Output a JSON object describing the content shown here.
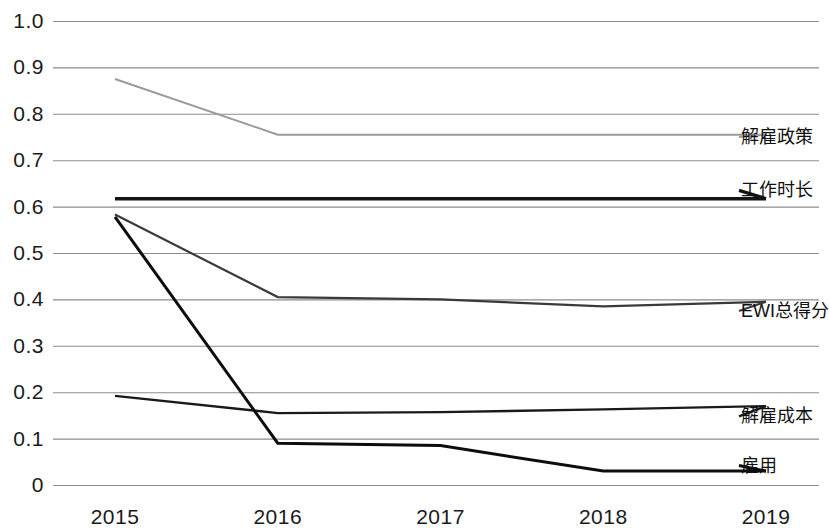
{
  "chart_data": {
    "type": "line",
    "title": "",
    "subtitle": "",
    "xlabel": "",
    "ylabel": "",
    "categories": [
      "2015",
      "2016",
      "2017",
      "2018",
      "2019"
    ],
    "x": [
      2015,
      2016,
      2017,
      2018,
      2019
    ],
    "ylim": [
      0,
      1.0
    ],
    "xlim": [
      2015,
      2019
    ],
    "grid": "horizontal",
    "legend_position": "right-inline-labels",
    "ytick_labels": [
      "1.0",
      "0.9",
      "0.8",
      "0.7",
      "0.6",
      "0.5",
      "0.4",
      "0.3",
      "0.2",
      "0.1",
      "0"
    ],
    "ytick_values": [
      1.0,
      0.9,
      0.8,
      0.7,
      0.6,
      0.5,
      0.4,
      0.3,
      0.2,
      0.1,
      0
    ],
    "series": [
      {
        "name": "解雇政策",
        "values": [
          0.875,
          0.755,
          0.755,
          0.755,
          0.755
        ],
        "color": "#9a9a9a",
        "width": 2.0,
        "label_y": 0.75
      },
      {
        "name": "工作时长",
        "values": [
          0.617,
          0.617,
          0.617,
          0.617,
          0.617
        ],
        "color": "#141414",
        "width": 3.4,
        "label_y": 0.635
      },
      {
        "name": "EWI总得分",
        "values": [
          0.583,
          0.405,
          0.4,
          0.385,
          0.395
        ],
        "color": "#3a3a3a",
        "width": 2.2,
        "label_y": 0.375
      },
      {
        "name": "解雇成本",
        "values": [
          0.192,
          0.155,
          0.157,
          0.163,
          0.17
        ],
        "color": "#1a1a1a",
        "width": 2.4,
        "label_y": 0.148
      },
      {
        "name": "雇用",
        "values": [
          0.578,
          0.09,
          0.085,
          0.03,
          0.03
        ],
        "color": "#0d0d0d",
        "width": 3.0,
        "label_y": 0.042
      }
    ]
  },
  "axes": {
    "y_labels": [
      "1.0",
      "0.9",
      "0.8",
      "0.7",
      "0.6",
      "0.5",
      "0.4",
      "0.3",
      "0.2",
      "0.1",
      "0"
    ],
    "x_labels": [
      "2015",
      "2016",
      "2017",
      "2018",
      "2019"
    ]
  },
  "labels": {
    "s0": "解雇政策",
    "s1": "工作时长",
    "s2": "EWI总得分",
    "s3": "解雇成本",
    "s4": "雇用"
  }
}
